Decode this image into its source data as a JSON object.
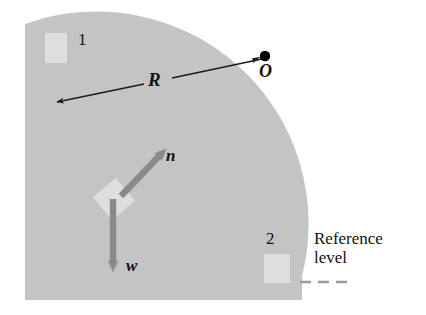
{
  "figure": {
    "background_color": "#ffffff"
  },
  "colors": {
    "ramp_fill": "#c4c4c4",
    "block_fill": "#dedede",
    "vector_arrow": "#8a8a8a",
    "radius_line": "#1a1a1a",
    "pivot_dot": "#000000",
    "dashed_line": "#9a9a9a",
    "text": "#111111"
  },
  "labels": {
    "position_1": "1",
    "position_2": "2",
    "radius": "R",
    "center": "O",
    "normal_force": "n",
    "weight": "w",
    "reference_level_line1": "Reference",
    "reference_level_line2": "level"
  },
  "geometry": {
    "center_of_curvature": {
      "x": 265,
      "y": 56
    },
    "radius_px": 212,
    "ramp_top_left": {
      "x": 25,
      "y": 24
    },
    "ramp_bottom": {
      "y": 300
    },
    "ramp_right": {
      "x": 302
    },
    "radius_arrow_from": {
      "x": 262,
      "y": 59
    },
    "radius_arrow_to": {
      "x": 55,
      "y": 103
    },
    "block_on_ramp": {
      "x": 114,
      "y": 199,
      "size": 30,
      "rotation_deg": -40
    },
    "block_position_1": {
      "x": 45,
      "y": 33,
      "width": 22,
      "height": 30
    },
    "block_position_2": {
      "x": 264,
      "y": 254,
      "width": 26,
      "height": 29
    },
    "normal_arrow_from": {
      "x": 121,
      "y": 196
    },
    "normal_arrow_to": {
      "x": 166,
      "y": 149
    },
    "weight_arrow_from": {
      "x": 113,
      "y": 199
    },
    "weight_arrow_to": {
      "x": 113,
      "y": 274
    },
    "dashed_line": {
      "x1": 300,
      "x2": 352,
      "y": 282
    }
  }
}
